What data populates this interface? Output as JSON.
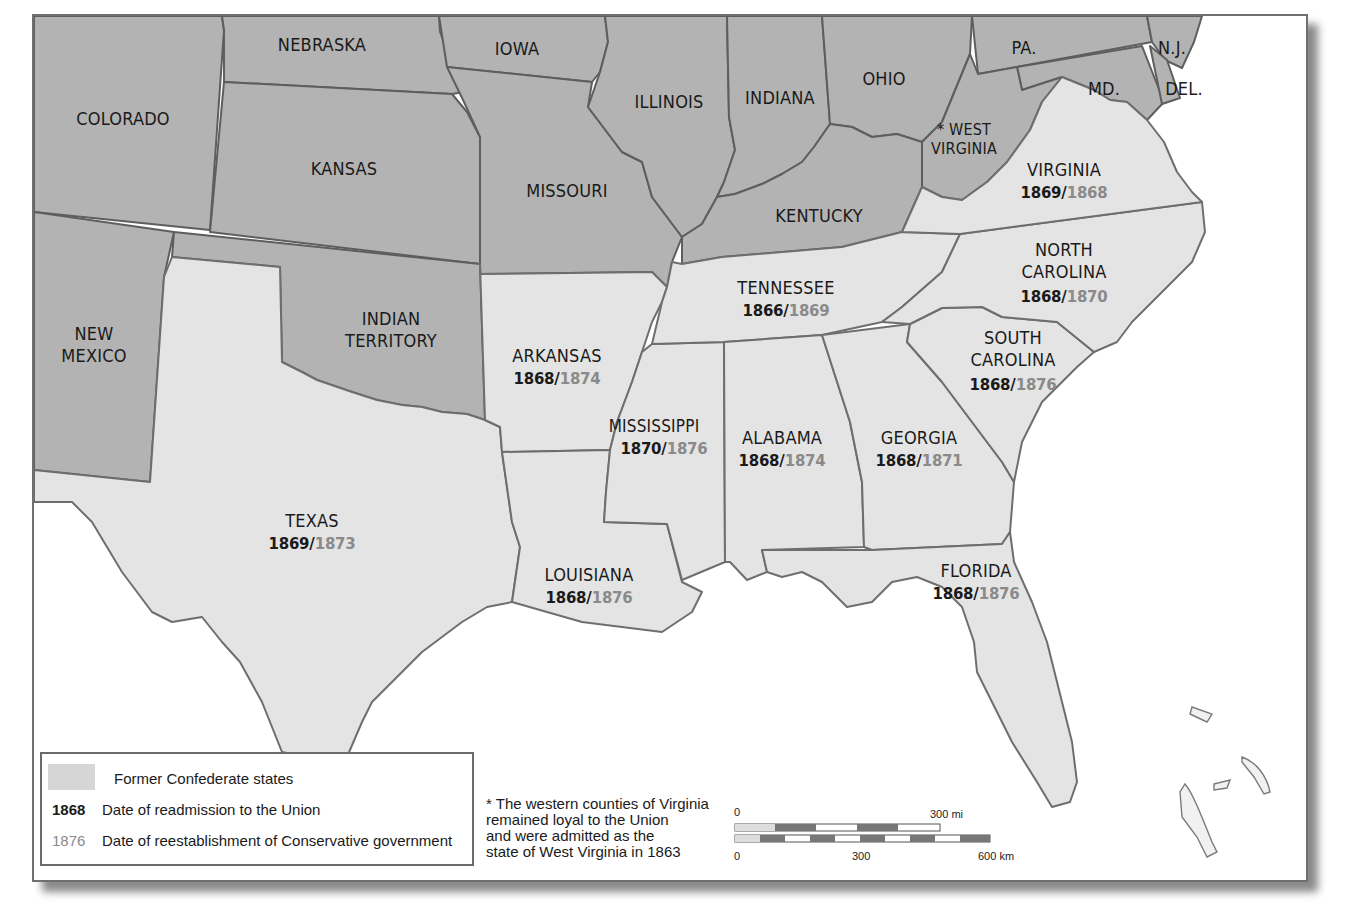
{
  "map": {
    "title_states_union": [
      {
        "name": "COLORADO"
      },
      {
        "name": "NEBRASKA"
      },
      {
        "name": "KANSAS"
      },
      {
        "name": "IOWA"
      },
      {
        "name": "MISSOURI"
      },
      {
        "name": "ILLINOIS"
      },
      {
        "name": "INDIANA"
      },
      {
        "name": "OHIO"
      },
      {
        "name": "KENTUCKY"
      },
      {
        "name": "PA."
      },
      {
        "name": "N.J."
      },
      {
        "name": "MD."
      },
      {
        "name": "DEL."
      },
      {
        "name": "WEST VIRGINIA",
        "line1": "* WEST",
        "line2": "VIRGINIA"
      },
      {
        "name": "NEW MEXICO",
        "line1": "NEW",
        "line2": "MEXICO"
      },
      {
        "name": "INDIAN TERRITORY",
        "line1": "INDIAN",
        "line2": "TERRITORY"
      }
    ],
    "confederate_states": [
      {
        "name": "VIRGINIA",
        "readmission": "1869",
        "conservative": "1868"
      },
      {
        "name": "NORTH CAROLINA",
        "line1": "NORTH",
        "line2": "CAROLINA",
        "readmission": "1868",
        "conservative": "1870"
      },
      {
        "name": "TENNESSEE",
        "readmission": "1866",
        "conservative": "1869"
      },
      {
        "name": "SOUTH CAROLINA",
        "line1": "SOUTH",
        "line2": "CAROLINA",
        "readmission": "1868",
        "conservative": "1876"
      },
      {
        "name": "ARKANSAS",
        "readmission": "1868",
        "conservative": "1874"
      },
      {
        "name": "MISSISSIPPI",
        "readmission": "1870",
        "conservative": "1876"
      },
      {
        "name": "ALABAMA",
        "readmission": "1868",
        "conservative": "1874"
      },
      {
        "name": "GEORGIA",
        "readmission": "1868",
        "conservative": "1871"
      },
      {
        "name": "TEXAS",
        "readmission": "1869",
        "conservative": "1873"
      },
      {
        "name": "LOUISIANA",
        "readmission": "1868",
        "conservative": "1876"
      },
      {
        "name": "FLORIDA",
        "readmission": "1868",
        "conservative": "1876"
      }
    ],
    "date_separator": "/"
  },
  "legend": {
    "items": [
      {
        "key": "",
        "label": "Former Confederate states",
        "swatch_color": "#d6d6d6"
      },
      {
        "key": "1868",
        "label": "Date of readmission to the Union",
        "key_color": "#1a1a1a"
      },
      {
        "key": "1876",
        "label": "Date of reestablishment of Conservative government",
        "key_color": "#8a8a8a"
      }
    ]
  },
  "footnote": {
    "text": "* The western counties of Virginia\nremained loyal to the Union\nand were admitted as the\nstate of West Virginia in 1863"
  },
  "scale_bar": {
    "miles_start": "0",
    "miles_end": "300 mi",
    "km_start": "0",
    "km_mid": "300",
    "km_end": "600 km"
  },
  "colors": {
    "union_fill": "#b3b3b3",
    "confederate_fill": "#e4e4e4",
    "water": "#ffffff",
    "readmission_text": "#1a1a1a",
    "conservative_text": "#8a8a8a"
  }
}
